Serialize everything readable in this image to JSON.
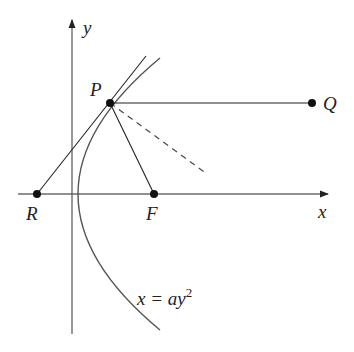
{
  "diagram": {
    "axes": {
      "x_label": "x",
      "y_label": "y"
    },
    "points": {
      "P": "P",
      "Q": "Q",
      "R": "R",
      "F": "F"
    },
    "curve_label": {
      "base": "x = ay",
      "exp": "2"
    },
    "colors": {
      "line": "#222222",
      "curve": "#555555"
    }
  }
}
